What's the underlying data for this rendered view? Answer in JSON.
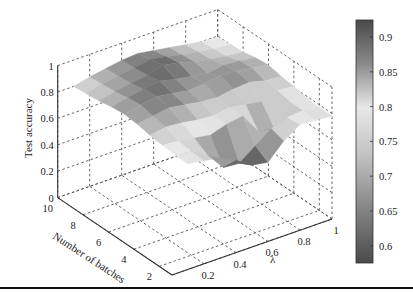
{
  "chart_data": {
    "type": "surface3d",
    "title": "",
    "xlabel": "λ",
    "ylabel": "Number of batches",
    "zlabel": "Test accuracy",
    "x_ticks": [
      "0.2",
      "0.4",
      "0.6",
      "0.8",
      "1"
    ],
    "y_ticks": [
      "2",
      "4",
      "6",
      "8",
      "10"
    ],
    "z_ticks": [
      "0",
      "0.2",
      "0.4",
      "0.6",
      "0.8",
      "1"
    ],
    "xlim": [
      0,
      1
    ],
    "ylim": [
      1,
      10
    ],
    "zlim": [
      0,
      1
    ],
    "grid": true,
    "colorbar": {
      "ticks": [
        "0.9",
        "0.85",
        "0.8",
        "0.75",
        "0.7",
        "0.65",
        "0.6"
      ],
      "range": [
        0.57,
        0.93
      ],
      "colormap": "gray-diverging (dark at ends, light at 0.8)"
    },
    "x": [
      0.1,
      0.2,
      0.3,
      0.4,
      0.5,
      0.6,
      0.7,
      0.8,
      0.9,
      1.0
    ],
    "y": [
      1,
      2,
      3,
      4,
      5,
      6,
      7,
      8,
      9,
      10
    ],
    "z": [
      [
        0.8,
        0.78,
        0.76,
        0.7,
        0.62,
        0.6,
        0.72,
        0.8,
        0.79,
        0.78
      ],
      [
        0.8,
        0.79,
        0.72,
        0.58,
        0.57,
        0.66,
        0.75,
        0.79,
        0.8,
        0.78
      ],
      [
        0.81,
        0.8,
        0.78,
        0.76,
        0.8,
        0.82,
        0.66,
        0.64,
        0.8,
        0.79
      ],
      [
        0.82,
        0.84,
        0.83,
        0.81,
        0.8,
        0.82,
        0.8,
        0.78,
        0.82,
        0.81
      ],
      [
        0.84,
        0.86,
        0.88,
        0.86,
        0.84,
        0.83,
        0.85,
        0.86,
        0.83,
        0.82
      ],
      [
        0.85,
        0.88,
        0.9,
        0.88,
        0.86,
        0.87,
        0.89,
        0.88,
        0.86,
        0.84
      ],
      [
        0.84,
        0.87,
        0.89,
        0.91,
        0.88,
        0.86,
        0.84,
        0.86,
        0.85,
        0.83
      ],
      [
        0.82,
        0.85,
        0.87,
        0.89,
        0.92,
        0.9,
        0.86,
        0.84,
        0.82,
        0.81
      ],
      [
        0.81,
        0.84,
        0.86,
        0.88,
        0.9,
        0.88,
        0.85,
        0.83,
        0.81,
        0.8
      ],
      [
        0.8,
        0.83,
        0.85,
        0.87,
        0.88,
        0.86,
        0.84,
        0.82,
        0.8,
        0.79
      ]
    ]
  }
}
